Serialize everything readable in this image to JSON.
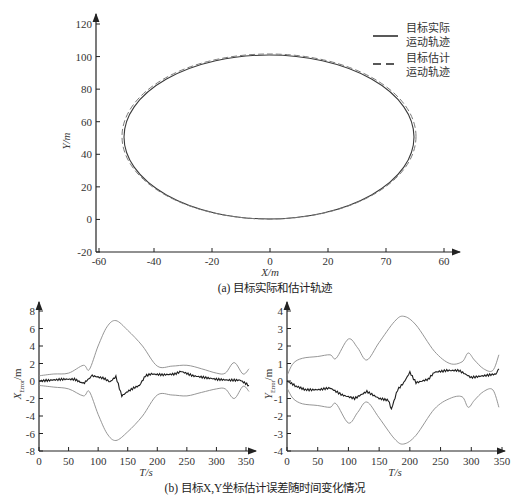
{
  "chart_data": [
    {
      "id": "a",
      "type": "line",
      "caption": "(a) 目标实际和估计轨迹",
      "xlabel": "X/m",
      "ylabel": "Y/m",
      "xticks": [
        "-60",
        "-40",
        "-20",
        "0",
        "20",
        "70",
        "60"
      ],
      "yticks": [
        "-20",
        "0",
        "20",
        "40",
        "60",
        "80",
        "100",
        "120"
      ],
      "xlim": [
        -60,
        60
      ],
      "ylim": [
        -20,
        120
      ],
      "grid": false,
      "legend_position": "upper right",
      "series": [
        {
          "name": "目标实际运动轨迹",
          "style": "solid",
          "shape": "ellipse",
          "center": [
            0,
            50
          ],
          "semi_axes": [
            50,
            50
          ]
        },
        {
          "name": "目标估计运动轨迹",
          "style": "dashed",
          "shape": "ellipse",
          "center": [
            0,
            50.5
          ],
          "semi_axes": [
            50.5,
            50.5
          ]
        }
      ],
      "legend": [
        {
          "line1": "目标实际",
          "line2": "运动轨迹",
          "style": "solid"
        },
        {
          "line1": "目标估计",
          "line2": "运动轨迹",
          "style": "dashed"
        }
      ]
    },
    {
      "id": "b-left",
      "type": "line",
      "xlabel": "T/s",
      "ylabel_main": "X",
      "ylabel_sub": "Error",
      "ylabel_unit": "/m",
      "xticks": [
        "0",
        "50",
        "100",
        "150",
        "200",
        "250",
        "300",
        "350"
      ],
      "yticks": [
        "-8",
        "-6",
        "-4",
        "-2",
        "0",
        "2",
        "4",
        "6",
        "8"
      ],
      "xlim": [
        0,
        350
      ],
      "ylim": [
        -8,
        8
      ],
      "grid": false,
      "series": [
        {
          "name": "upper bound",
          "x": [
            0,
            25,
            50,
            75,
            85,
            100,
            115,
            130,
            150,
            175,
            200,
            225,
            250,
            275,
            300,
            315,
            330,
            345,
            355
          ],
          "values": [
            0.6,
            0.8,
            0.9,
            1.8,
            1.3,
            4.0,
            6.2,
            6.9,
            5.8,
            4.0,
            1.7,
            1.7,
            1.8,
            1.4,
            0.9,
            0.9,
            2.1,
            0.8,
            1.4
          ]
        },
        {
          "name": "error",
          "x": [
            0,
            20,
            40,
            60,
            75,
            90,
            110,
            120,
            130,
            140,
            150,
            160,
            170,
            180,
            190,
            210,
            230,
            240,
            260,
            280,
            300,
            320,
            340,
            355
          ],
          "values": [
            0.0,
            0.1,
            0.2,
            0.2,
            -0.3,
            0.6,
            0.3,
            -0.1,
            0.5,
            -1.7,
            -1.2,
            -0.8,
            -0.5,
            0.6,
            0.8,
            0.7,
            0.8,
            1.1,
            0.6,
            0.4,
            0.2,
            0.1,
            0.1,
            -0.5
          ]
        },
        {
          "name": "lower bound",
          "x": [
            0,
            25,
            50,
            75,
            85,
            100,
            115,
            130,
            150,
            175,
            200,
            225,
            250,
            275,
            300,
            315,
            330,
            345,
            355
          ],
          "values": [
            -0.5,
            -0.7,
            -0.9,
            -1.7,
            -1.2,
            -3.8,
            -6.0,
            -6.8,
            -5.8,
            -4.0,
            -1.6,
            -1.6,
            -1.7,
            -1.3,
            -0.9,
            -0.9,
            -2.0,
            -0.6,
            -1.2
          ]
        }
      ]
    },
    {
      "id": "b-right",
      "type": "line",
      "xlabel": "T/s",
      "ylabel_main": "Y",
      "ylabel_sub": "Error",
      "ylabel_unit": "/m",
      "xticks": [
        "0",
        "50",
        "100",
        "150",
        "200",
        "250",
        "300",
        "350"
      ],
      "yticks": [
        "-4",
        "-3",
        "-2",
        "-1",
        "0",
        "1",
        "2",
        "3",
        "4"
      ],
      "xlim": [
        0,
        350
      ],
      "ylim": [
        -4,
        4
      ],
      "grid": false,
      "series": [
        {
          "name": "upper bound",
          "x": [
            0,
            10,
            25,
            50,
            70,
            80,
            100,
            115,
            130,
            150,
            175,
            190,
            210,
            240,
            265,
            285,
            295,
            305,
            320,
            335,
            345
          ],
          "values": [
            0.3,
            1.0,
            1.3,
            1.4,
            1.5,
            1.3,
            2.4,
            1.9,
            1.2,
            2.2,
            3.4,
            3.7,
            3.2,
            1.7,
            1.0,
            1.1,
            1.6,
            1.2,
            0.7,
            0.6,
            1.5
          ]
        },
        {
          "name": "error",
          "x": [
            0,
            15,
            30,
            50,
            70,
            90,
            110,
            130,
            150,
            165,
            170,
            180,
            190,
            200,
            210,
            230,
            240,
            260,
            280,
            300,
            320,
            340,
            345
          ],
          "values": [
            0.0,
            -0.3,
            -0.5,
            -0.5,
            -0.4,
            -0.8,
            -1.0,
            -0.6,
            -1.0,
            -1.1,
            -1.6,
            -0.5,
            -0.1,
            0.5,
            -0.1,
            0.1,
            0.5,
            0.6,
            0.6,
            0.2,
            0.3,
            0.4,
            0.7
          ]
        },
        {
          "name": "lower bound",
          "x": [
            0,
            10,
            25,
            50,
            70,
            80,
            100,
            115,
            130,
            150,
            175,
            190,
            210,
            240,
            265,
            285,
            295,
            305,
            320,
            335,
            345
          ],
          "values": [
            -0.4,
            -1.0,
            -1.3,
            -1.4,
            -1.5,
            -1.3,
            -2.4,
            -1.8,
            -1.2,
            -2.1,
            -3.3,
            -3.6,
            -3.1,
            -1.6,
            -1.0,
            -0.9,
            -1.5,
            -1.1,
            -0.6,
            -0.5,
            -1.5
          ]
        }
      ]
    }
  ],
  "caption_b": "(b) 目标X,Y坐标估计误差随时间变化情况",
  "colors": {
    "axis": "#222222",
    "solid": "#2a2a2a",
    "bound": "#8a8a8a",
    "error": "#1e1e1e"
  }
}
